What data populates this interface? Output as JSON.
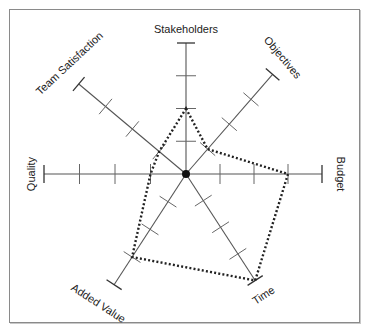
{
  "chart_data": {
    "type": "radar",
    "title": "",
    "scale_max": 4,
    "tick_count": 4,
    "axes": [
      "Stakeholders",
      "Objectives",
      "Budget",
      "Time",
      "Added Value",
      "Quality",
      "Team Satisfaction"
    ],
    "series": [
      {
        "name": "Project profile",
        "values": [
          2,
          1,
          3,
          4,
          3,
          1,
          1
        ],
        "line_style": "dotted"
      }
    ],
    "grid": false,
    "legend": null,
    "center_marker": "filled-circle"
  },
  "colors": {
    "axis": "#555555",
    "series": "#222222",
    "frame": "#8a8a8a"
  }
}
